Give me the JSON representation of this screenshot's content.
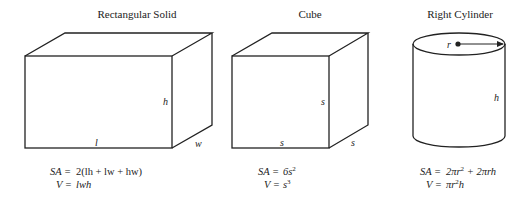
{
  "figures": [
    {
      "title": "Rectangular Solid",
      "labels": {
        "length": "l",
        "height": "h",
        "width": "w"
      },
      "formulas": {
        "sa_lhs": "SA =",
        "sa_rhs": "2(lh + lw  + hw)",
        "v_lhs": "V =",
        "v_rhs": "lwh"
      }
    },
    {
      "title": "Cube",
      "labels": {
        "bottom": "s",
        "height": "s",
        "depth": "s"
      },
      "formulas": {
        "sa_lhs": "SA =",
        "sa_rhs_base": "6s",
        "sa_rhs_exp": "2",
        "v_lhs": "V =",
        "v_rhs_base": "s",
        "v_rhs_exp": "3"
      }
    },
    {
      "title": "Right Cylinder",
      "labels": {
        "radius": "r",
        "height": "h"
      },
      "formulas": {
        "sa_lhs": "SA =",
        "sa_a": "2πr",
        "sa_a_exp": "2",
        "sa_b": " + 2πrh",
        "v_lhs": "V =",
        "v_a": "πr",
        "v_a_exp": "2",
        "v_b": "h"
      }
    }
  ],
  "colors": {
    "stroke": "#222222",
    "background": "#ffffff"
  }
}
